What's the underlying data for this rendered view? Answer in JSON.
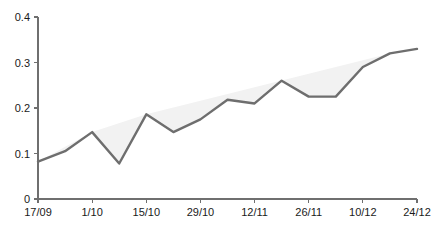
{
  "chart_data": {
    "type": "line",
    "title": "",
    "xlabel": "",
    "ylabel": "",
    "ylim": [
      0,
      0.4
    ],
    "y_ticks": [
      "0",
      "0.1",
      "0.2",
      "0.3",
      "0.4"
    ],
    "y_tick_values": [
      0,
      0.1,
      0.2,
      0.3,
      0.4
    ],
    "x_ticks": [
      "17/09",
      "1/10",
      "15/10",
      "29/10",
      "12/11",
      "26/11",
      "10/12",
      "24/12"
    ],
    "grid": false,
    "legend": null,
    "line_color": "#6e6e6e",
    "fill_color": "#f2f2f2",
    "axis_color": "#6f6f6f",
    "series": [
      {
        "name": "value",
        "x": [
          "17/09",
          "24/09",
          "1/10",
          "8/10",
          "15/10",
          "22/10",
          "29/10",
          "5/11",
          "12/11",
          "19/11",
          "26/11",
          "3/12",
          "10/12",
          "17/12",
          "24/12"
        ],
        "values": [
          0.082,
          0.105,
          0.147,
          0.078,
          0.186,
          0.147,
          0.175,
          0.218,
          0.21,
          0.26,
          0.225,
          0.225,
          0.29,
          0.32,
          0.33
        ]
      }
    ]
  }
}
